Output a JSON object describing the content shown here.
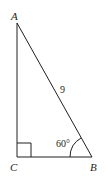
{
  "diagram": {
    "type": "right-triangle",
    "vertices": {
      "A": {
        "label": "A",
        "x": 17,
        "y": 23
      },
      "B": {
        "label": "B",
        "x": 92,
        "y": 157
      },
      "C": {
        "label": "C",
        "x": 17,
        "y": 157
      }
    },
    "right_angle_at": "C",
    "hypotenuse_label": "9",
    "angle_label": "60°",
    "angle_at": "B",
    "colors": {
      "stroke": "#231f20",
      "background": "#ffffff"
    }
  }
}
